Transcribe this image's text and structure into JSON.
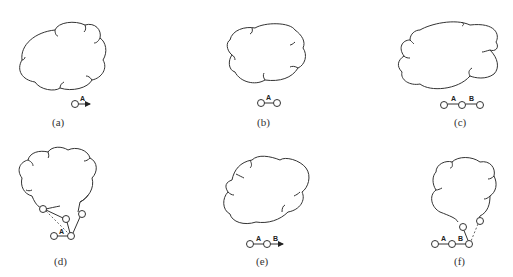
{
  "figure": {
    "panels": [
      {
        "id": "a",
        "caption": "(a)",
        "edges": [
          {
            "label": "A",
            "type": "arrow"
          }
        ]
      },
      {
        "id": "b",
        "caption": "(b)",
        "edges": [
          {
            "label": "A",
            "type": "link"
          }
        ]
      },
      {
        "id": "c",
        "caption": "(c)",
        "edges": [
          {
            "label": "A",
            "type": "link"
          },
          {
            "label": "B",
            "type": "link"
          }
        ]
      },
      {
        "id": "d",
        "caption": "(d)",
        "edges": [
          {
            "label": "A",
            "type": "link"
          }
        ]
      },
      {
        "id": "e",
        "caption": "(e)",
        "edges": [
          {
            "label": "A",
            "type": "link"
          },
          {
            "label": "B",
            "type": "arrow"
          }
        ]
      },
      {
        "id": "f",
        "caption": "(f)",
        "edges": [
          {
            "label": "A",
            "type": "link"
          },
          {
            "label": "B",
            "type": "link"
          }
        ]
      }
    ]
  }
}
